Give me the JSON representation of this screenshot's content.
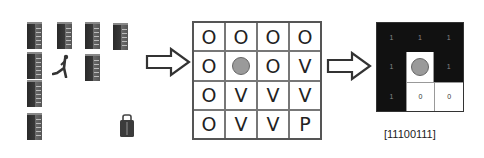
{
  "scene": {
    "icons": [
      {
        "type": "server",
        "x": 27,
        "y": 22
      },
      {
        "type": "server",
        "x": 57,
        "y": 22
      },
      {
        "type": "server",
        "x": 85,
        "y": 22
      },
      {
        "type": "server",
        "x": 113,
        "y": 23
      },
      {
        "type": "server",
        "x": 27,
        "y": 52
      },
      {
        "type": "person",
        "x": 52,
        "y": 54
      },
      {
        "type": "server",
        "x": 85,
        "y": 54
      },
      {
        "type": "server",
        "x": 27,
        "y": 80
      },
      {
        "type": "server",
        "x": 27,
        "y": 113
      },
      {
        "type": "bag",
        "x": 119,
        "y": 114
      }
    ]
  },
  "arrows": [
    {
      "x": 145,
      "y": 47
    },
    {
      "x": 326,
      "y": 51
    }
  ],
  "occupancy_grid": {
    "rows": [
      [
        "O",
        "O",
        "O",
        "O"
      ],
      [
        "O",
        "●",
        "O",
        "V"
      ],
      [
        "O",
        "V",
        "V",
        "V"
      ],
      [
        "O",
        "V",
        "V",
        "P"
      ]
    ]
  },
  "local_view": {
    "rows": [
      [
        "1",
        "1",
        "1"
      ],
      [
        "1",
        "●",
        "1"
      ],
      [
        "1",
        "0",
        "0"
      ]
    ],
    "code": "[11100111]"
  },
  "colors": {
    "agent_circle": "#9a9a9a",
    "blocked": "#111111",
    "free": "#ffffff"
  }
}
